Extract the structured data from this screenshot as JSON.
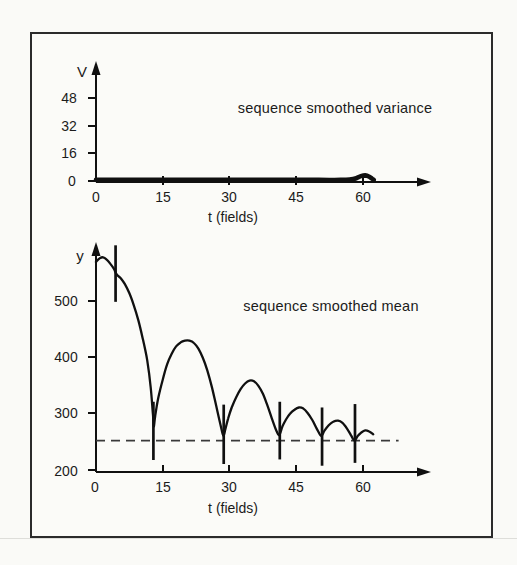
{
  "figure": {
    "background": "#fafaf7",
    "frame_color": "#2b2b2b",
    "ink_color": "#101010",
    "dashed_line_color": "#3a3a3a"
  },
  "chart_data": [
    {
      "type": "line",
      "title": "sequence smoothed variance",
      "xlabel": "t (fields)",
      "ylabel": "V",
      "xticks": [
        0,
        15,
        30,
        45,
        60
      ],
      "yticks": [
        0,
        16,
        32,
        48
      ],
      "xlim": [
        0,
        75
      ],
      "ylim": [
        0,
        66
      ],
      "grid": false,
      "legend": "none",
      "series": [
        {
          "name": "smoothed variance",
          "style": "thick",
          "points": [
            [
              0,
              1.2
            ],
            [
              10,
              1.2
            ],
            [
              20,
              1.2
            ],
            [
              30,
              1.2
            ],
            [
              40,
              1.2
            ],
            [
              50,
              1.2
            ],
            [
              55,
              1.2
            ],
            [
              57,
              1.4
            ],
            [
              58.5,
              2.2
            ],
            [
              59.5,
              3.4
            ],
            [
              60.5,
              3.8
            ],
            [
              61.3,
              3.2
            ],
            [
              62,
              2
            ],
            [
              62.4,
              1.2
            ]
          ]
        }
      ]
    },
    {
      "type": "line",
      "title": "sequence smoothed mean",
      "xlabel": "t (fields)",
      "ylabel": "y",
      "xticks": [
        0,
        15,
        30,
        45,
        60
      ],
      "yticks": [
        200,
        300,
        400,
        500
      ],
      "xlim": [
        0,
        75
      ],
      "ylim": [
        200,
        620
      ],
      "grid": false,
      "legend": "none",
      "reference_line": {
        "y": 255,
        "style": "dashed",
        "x_start": 0,
        "x_end": 68
      },
      "cut_markers": [
        {
          "t": 4.4,
          "y_from": 498,
          "y_to": 597
        },
        {
          "t": 12.9,
          "y_from": 221,
          "y_to": 323
        },
        {
          "t": 28.7,
          "y_from": 214,
          "y_to": 318
        },
        {
          "t": 41.3,
          "y_from": 222,
          "y_to": 323
        },
        {
          "t": 50.8,
          "y_from": 211,
          "y_to": 313
        },
        {
          "t": 58.2,
          "y_from": 216,
          "y_to": 319
        }
      ],
      "series": [
        {
          "name": "smoothed mean",
          "style": "normal",
          "points": [
            [
              0,
              568
            ],
            [
              0.8,
              574
            ],
            [
              1.6,
              576
            ],
            [
              2.4,
              572
            ],
            [
              3.2,
              565
            ],
            [
              4,
              556
            ],
            [
              4.5,
              548
            ],
            [
              5,
              543
            ],
            [
              5.6,
              539
            ],
            [
              6.5,
              529
            ],
            [
              7.5,
              513
            ],
            [
              8.5,
              492
            ],
            [
              9.5,
              466
            ],
            [
              10.5,
              434
            ],
            [
              11.5,
              396
            ],
            [
              12.3,
              348
            ],
            [
              12.8,
              300
            ],
            [
              13,
              280
            ],
            [
              13.3,
              298
            ],
            [
              14,
              330
            ],
            [
              15,
              362
            ],
            [
              16,
              389
            ],
            [
              17,
              407
            ],
            [
              18,
              420
            ],
            [
              19,
              427
            ],
            [
              20,
              430
            ],
            [
              21,
              430
            ],
            [
              22,
              426
            ],
            [
              23,
              416
            ],
            [
              24,
              400
            ],
            [
              25,
              378
            ],
            [
              26,
              350
            ],
            [
              27,
              316
            ],
            [
              28,
              282
            ],
            [
              28.6,
              264
            ],
            [
              29.1,
              276
            ],
            [
              29.7,
              294
            ],
            [
              30.5,
              313
            ],
            [
              31.5,
              331
            ],
            [
              32.5,
              345
            ],
            [
              33.5,
              355
            ],
            [
              34.5,
              360
            ],
            [
              35.5,
              359
            ],
            [
              36.5,
              351
            ],
            [
              37.5,
              337
            ],
            [
              38.5,
              317
            ],
            [
              39.5,
              294
            ],
            [
              40.5,
              273
            ],
            [
              41.2,
              265
            ],
            [
              41.9,
              280
            ],
            [
              42.7,
              292
            ],
            [
              43.6,
              302
            ],
            [
              44.6,
              309
            ],
            [
              45.6,
              313
            ],
            [
              46.6,
              311
            ],
            [
              47.6,
              303
            ],
            [
              48.6,
              291
            ],
            [
              49.6,
              276
            ],
            [
              50.6,
              263
            ],
            [
              51.3,
              272
            ],
            [
              52.3,
              282
            ],
            [
              53.3,
              288
            ],
            [
              54.4,
              290
            ],
            [
              55.4,
              286
            ],
            [
              56.4,
              276
            ],
            [
              57.4,
              263
            ],
            [
              58.1,
              255
            ],
            [
              58.8,
              263
            ],
            [
              59.6,
              269
            ],
            [
              60.5,
              273
            ],
            [
              61.4,
              271
            ],
            [
              62.3,
              266
            ]
          ]
        }
      ]
    }
  ]
}
